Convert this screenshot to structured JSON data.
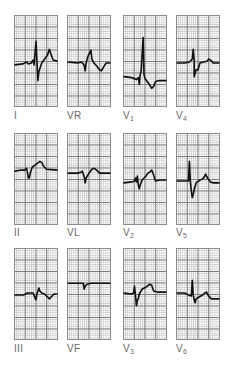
{
  "figure": {
    "layout": {
      "columns_x": [
        14,
        67,
        123,
        176
      ],
      "rows_y": [
        15,
        133,
        248
      ],
      "panel_width": 44,
      "panel_height": 92
    },
    "colors": {
      "trace": "#111111",
      "major_grid": "#7a7a7a",
      "minor_grid": "#cfcfcf",
      "label": "#6a6a6a"
    }
  },
  "leads": [
    {
      "id": "I",
      "label": "I",
      "sub": "",
      "col": 0,
      "row": 0,
      "points": "0,50 8,49 12,47 14,49 17,48 19,45 20,50 22,26 23,46 24,66 25,57 28,48 31,44 34,40 36,34 38,40 40,45 44,46"
    },
    {
      "id": "VR",
      "label": "VR",
      "sub": "",
      "col": 1,
      "row": 0,
      "points": "0,47 10,48 14,47 16,49 17,51 18,56 19,48 21,41 24,35 25,44 27,48 30,51 33,55 35,56 38,51 40,48 44,48"
    },
    {
      "id": "V1",
      "label": "V",
      "sub": "1",
      "col": 2,
      "row": 0,
      "points": "0,62 8,63 13,65 15,63 16,70 17,60 18,56 20,22 21,60 22,64 26,69 29,74 31,72 33,67 37,66 44,66"
    },
    {
      "id": "V4",
      "label": "V",
      "sub": "4",
      "col": 3,
      "row": 0,
      "points": "0,48 8,48 13,47 16,44 17,34 18,45 18,62 20,55 22,55 24,48 28,47 32,46 33,44 35,45 38,48 40,48 44,48"
    },
    {
      "id": "II",
      "label": "II",
      "sub": "",
      "col": 0,
      "row": 1,
      "points": "0,38 5,37 10,37 12,35 13,39 14,45 15,45 16,40 18,34 22,31 26,28 28,29 30,33 33,36 44,37"
    },
    {
      "id": "VL",
      "label": "VL",
      "sub": "",
      "col": 1,
      "row": 1,
      "points": "0,40 10,40 14,39 15,38 17,44 18,50 19,45 22,40 25,36 27,35 29,36 31,38 33,40 44,40"
    },
    {
      "id": "V2",
      "label": "V",
      "sub": "2",
      "col": 2,
      "row": 1,
      "points": "0,50 8,49 11,48 12,45 13,49 14,43 15,52 16,56 17,52 19,47 23,43 25,40 27,39 29,37 30,39 31,42 33,48 37,47 44,47"
    },
    {
      "id": "V5",
      "label": "V",
      "sub": "5",
      "col": 3,
      "row": 1,
      "points": "0,48 10,48 12,48 13,28 14,49 15,58 16,65 17,62 18,57 20,50 24,47 27,46 29,43 30,41 32,45 35,49 38,50 44,50"
    },
    {
      "id": "III",
      "label": "III",
      "sub": "",
      "col": 0,
      "row": 2,
      "points": "0,47 9,47 13,45 19,45 21,50 22,52 23,46 25,40 26,43 28,45 31,46 34,49 36,51 38,49 41,46 44,46"
    },
    {
      "id": "VF",
      "label": "VF",
      "sub": "",
      "col": 1,
      "row": 2,
      "points": "0,35 8,35 12,35 16,35 17,41 18,38 20,36 24,35 32,35 44,35"
    },
    {
      "id": "V3",
      "label": "V",
      "sub": "3",
      "col": 2,
      "row": 2,
      "points": "0,45 8,46 10,45 11,38 12,47 13,58 14,52 15,51 16,46 19,41 23,39 27,36 29,37 31,43 35,44 44,44"
    },
    {
      "id": "V6",
      "label": "V",
      "sub": "6",
      "col": 3,
      "row": 2,
      "points": "0,45 8,45 12,47 15,48 16,32 17,47 18,52 19,55 20,51 23,49 27,47 29,45 31,44 33,48 36,51 40,51 44,51"
    }
  ]
}
